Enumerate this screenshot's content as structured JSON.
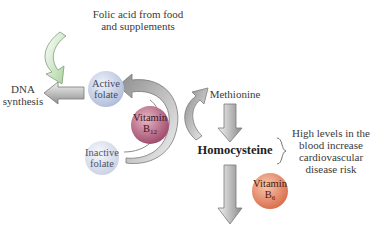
{
  "labels": {
    "folic_acid_line1": "Folic acid from food",
    "folic_acid_line2": "and supplements",
    "dna_line1": "DNA",
    "dna_line2": "synthesis",
    "methionine": "Methionine",
    "homocysteine": "Homocysteine",
    "risk_line1": "High levels in the",
    "risk_line2": "blood increase",
    "risk_line3": "cardiovascular",
    "risk_line4": "disease risk"
  },
  "nodes": {
    "active_folate": {
      "line1": "Active",
      "line2": "folate",
      "color": "#c9d3e8"
    },
    "inactive_folate": {
      "line1": "Inactive",
      "line2": "folate",
      "color": "#dde3ef"
    },
    "vitamin_b12": {
      "line1": "Vitamin",
      "line2": "B",
      "sub": "12",
      "color": "#b0607e"
    },
    "vitamin_b6": {
      "line1": "Vitamin",
      "line2": "B",
      "sub": "6",
      "color": "#e48a6c"
    }
  },
  "colors": {
    "arrow_gray": "#9a9a9a",
    "arrow_green": "#b9dcb0"
  }
}
